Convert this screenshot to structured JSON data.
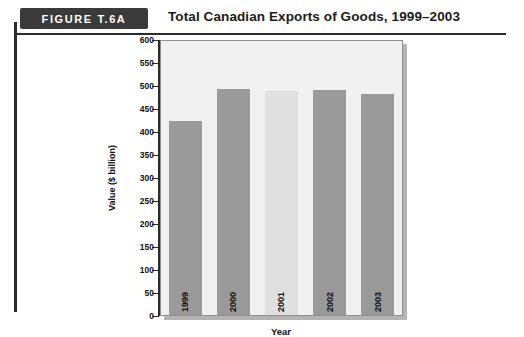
{
  "figure": {
    "badge_label": "FIGURE T.6A",
    "title": "Total Canadian Exports of Goods, 1999–2003"
  },
  "colors": {
    "badge_bg": "#3a3a3a",
    "bar_default": "#9a9a9a",
    "bar_highlight": "#e0e0e0",
    "plot_bg": "#f1f1f1",
    "axis": "#2b2b2b"
  },
  "chart_data": {
    "type": "bar",
    "title": "Total Canadian Exports of Goods, 1999–2003",
    "xlabel": "Year",
    "ylabel": "Value ($ billion)",
    "categories": [
      "1999",
      "2000",
      "2001",
      "2002",
      "2003"
    ],
    "values": [
      425,
      495,
      490,
      492,
      483
    ],
    "bar_colors": [
      "#9a9a9a",
      "#9a9a9a",
      "#e0e0e0",
      "#9a9a9a",
      "#9a9a9a"
    ],
    "ylim": [
      0,
      600
    ],
    "ytick_step": 50,
    "yticks": [
      600,
      550,
      500,
      450,
      400,
      350,
      300,
      250,
      200,
      150,
      100,
      50,
      0
    ],
    "ytick_labels": [
      "600",
      "550",
      "500",
      "450",
      "400",
      "350",
      "300",
      "250",
      "200",
      "150",
      "100",
      "50",
      "0"
    ],
    "grid": false,
    "legend": null,
    "labels_inside_bars": true
  }
}
